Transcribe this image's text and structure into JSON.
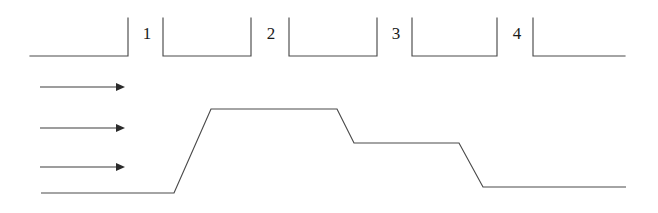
{
  "figure": {
    "title": "",
    "background_color": "#ffffff",
    "line_color": "#4a4a4a",
    "text_color": "#1a1a1a",
    "width": 658,
    "height": 213
  },
  "channel": {
    "name": "stepped-channel-walls",
    "description": "Upper boundary drawn as four gap-separated wall segments with vertical end risers",
    "wall_top_y": 18,
    "wall_bottom_y": 56,
    "segments": [
      {
        "id": "segment-0",
        "x_start": 30,
        "x_end": 128,
        "riser": "right"
      },
      {
        "id": "segment-1",
        "x_start": 163,
        "x_end": 251,
        "riser": "both"
      },
      {
        "id": "segment-2",
        "x_start": 289,
        "x_end": 377,
        "riser": "both"
      },
      {
        "id": "segment-3",
        "x_start": 412,
        "x_end": 497,
        "riser": "both"
      },
      {
        "id": "segment-4",
        "x_start": 533,
        "x_end": 625,
        "riser": "left"
      }
    ]
  },
  "gap_labels": [
    {
      "name": "gap-label-1",
      "text": "1",
      "x": 147,
      "y": 34
    },
    {
      "name": "gap-label-2",
      "text": "2",
      "x": 271,
      "y": 34
    },
    {
      "name": "gap-label-3",
      "text": "3",
      "x": 396,
      "y": 34
    },
    {
      "name": "gap-label-4",
      "text": "4",
      "x": 517,
      "y": 34
    }
  ],
  "flow_arrows": [
    {
      "name": "flow-arrow-top",
      "x_start": 40,
      "x_end": 123,
      "y": 87
    },
    {
      "name": "flow-arrow-middle",
      "x_start": 40,
      "x_end": 123,
      "y": 128
    },
    {
      "name": "flow-arrow-bottom",
      "x_start": 40,
      "x_end": 123,
      "y": 167
    }
  ],
  "chart_data": {
    "type": "line",
    "title": "",
    "xlabel": "",
    "ylabel": "",
    "xlim": [
      0,
      658
    ],
    "ylim": [
      213,
      0
    ],
    "grid": false,
    "legend": null,
    "series": [
      {
        "name": "free-surface-profile",
        "points": [
          [
            41,
            193
          ],
          [
            174,
            193
          ],
          [
            211,
            109
          ],
          [
            337,
            109
          ],
          [
            354,
            143
          ],
          [
            459,
            143
          ],
          [
            483,
            187
          ],
          [
            626,
            187
          ]
        ]
      }
    ],
    "annotations": [
      {
        "text": "1",
        "x": 147,
        "y": 34
      },
      {
        "text": "2",
        "x": 271,
        "y": 34
      },
      {
        "text": "3",
        "x": 396,
        "y": 34
      },
      {
        "text": "4",
        "x": 517,
        "y": 34
      }
    ]
  }
}
